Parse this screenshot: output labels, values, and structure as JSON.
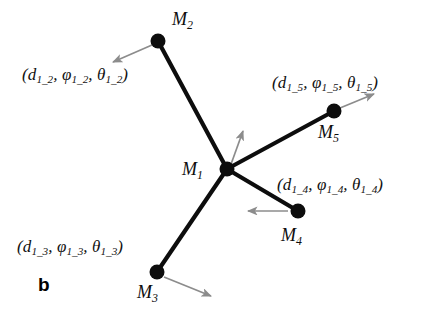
{
  "figure": {
    "panel_letter": "b",
    "background_color": "#ffffff",
    "edge_color": "#0d0d0d",
    "node_color": "#0d0d0d",
    "arrow_color": "#8c8c8c",
    "width": 431,
    "height": 315
  },
  "nodes": [
    {
      "id": "M1",
      "label_base": "M",
      "label_sub": "1",
      "x": 227,
      "y": 169,
      "r": 7.5,
      "label_x": 182,
      "label_y": 160
    },
    {
      "id": "M2",
      "label_base": "M",
      "label_sub": "2",
      "x": 158,
      "y": 41,
      "r": 7.5,
      "label_x": 172,
      "label_y": 10
    },
    {
      "id": "M3",
      "label_base": "M",
      "label_sub": "3",
      "x": 157,
      "y": 272,
      "r": 7.5,
      "label_x": 137,
      "label_y": 283
    },
    {
      "id": "M4",
      "label_base": "M",
      "label_sub": "4",
      "x": 298,
      "y": 211,
      "r": 7.5,
      "label_x": 281,
      "label_y": 226
    },
    {
      "id": "M5",
      "label_base": "M",
      "label_sub": "5",
      "x": 334,
      "y": 111,
      "r": 7.5,
      "label_x": 318,
      "label_y": 123
    }
  ],
  "edges": [
    {
      "id": "e12",
      "from": "M1",
      "to": "M2",
      "x1": 227,
      "y1": 169,
      "x2": 158,
      "y2": 41
    },
    {
      "id": "e13",
      "from": "M1",
      "to": "M3",
      "x1": 227,
      "y1": 169,
      "x2": 157,
      "y2": 272
    },
    {
      "id": "e14",
      "from": "M1",
      "to": "M4",
      "x1": 227,
      "y1": 169,
      "x2": 298,
      "y2": 211
    },
    {
      "id": "e15",
      "from": "M1",
      "to": "M5",
      "x1": 227,
      "y1": 169,
      "x2": 334,
      "y2": 111
    }
  ],
  "edge_labels": [
    {
      "id": "l12",
      "edge": "e12",
      "d": "d",
      "phi": "φ",
      "theta": "θ",
      "sub": "1_2",
      "text": "(d1_2, φ1_2, θ1_2)",
      "x": 22,
      "y": 66
    },
    {
      "id": "l15",
      "edge": "e15",
      "d": "d",
      "phi": "φ",
      "theta": "θ",
      "sub": "1_5",
      "text": "(d1_5, φ1_5, θ1_5)",
      "x": 272,
      "y": 74
    },
    {
      "id": "l14",
      "edge": "e14",
      "d": "d",
      "phi": "φ",
      "theta": "θ",
      "sub": "1_4",
      "text": "(d1_4, φ1_4, θ1_4)",
      "x": 277,
      "y": 176
    },
    {
      "id": "l13",
      "edge": "e13",
      "d": "d",
      "phi": "φ",
      "theta": "θ",
      "sub": "1_3",
      "text": "(d1_3, φ1_3, θ1_3)",
      "x": 17,
      "y": 238
    }
  ],
  "motion_arrows": [
    {
      "id": "a1",
      "node": "M1",
      "x1": 230,
      "y1": 167,
      "x2": 243,
      "y2": 131,
      "direction": "up-right"
    },
    {
      "id": "a2",
      "node": "M2",
      "x1": 152,
      "y1": 45,
      "x2": 113,
      "y2": 62,
      "direction": "down-left"
    },
    {
      "id": "a3",
      "node": "M3",
      "x1": 164,
      "y1": 277,
      "x2": 211,
      "y2": 296,
      "direction": "down-right"
    },
    {
      "id": "a4",
      "node": "M4",
      "x1": 288,
      "y1": 211,
      "x2": 248,
      "y2": 211,
      "direction": "left"
    },
    {
      "id": "a5",
      "node": "M5",
      "x1": 340,
      "y1": 108,
      "x2": 374,
      "y2": 94,
      "direction": "up-right"
    }
  ]
}
